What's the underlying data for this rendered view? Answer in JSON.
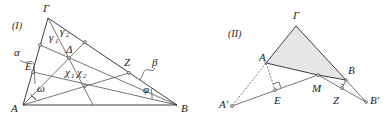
{
  "diagram_I": {
    "tag": "(I)",
    "vertices": {
      "gamma": "Γ",
      "A": "A",
      "B": "B"
    },
    "points": {
      "E": "E",
      "Delta": "Δ",
      "Z": "Z"
    },
    "angles": {
      "alpha": "α",
      "beta": "β",
      "omega": "ω",
      "phi": "φ",
      "gamma1": "γ",
      "gamma1_sub": "1",
      "gamma2": "γ",
      "gamma2_sub": "2",
      "chi1": "χ",
      "chi1_sub": "1",
      "chi2": "χ",
      "chi2_sub": "2"
    }
  },
  "diagram_II": {
    "tag": "(II)",
    "vertices": {
      "gamma": "Γ",
      "A": "A",
      "B": "B",
      "A_prime": "A′",
      "B_prime": "B′"
    },
    "points": {
      "E": "E",
      "M": "M",
      "Z": "Z"
    },
    "colors": {
      "shade": "#e6e6e6"
    }
  }
}
